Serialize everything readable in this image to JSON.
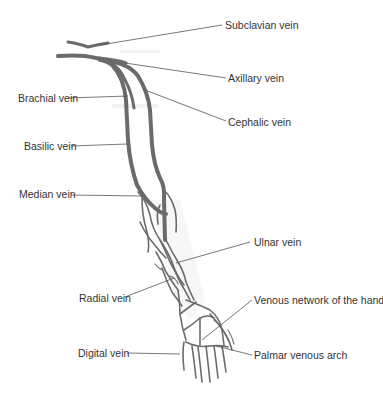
{
  "diagram": {
    "colors": {
      "vein": "#6b6b6b",
      "leader": "#555555",
      "label": "#333333",
      "background": "#ffffff"
    },
    "labels": {
      "subclavian": "Subclavian vein",
      "axillary": "Axillary vein",
      "brachial": "Brachial vein",
      "cephalic": "Cephalic vein",
      "basilic": "Basilic vein",
      "median": "Median vein",
      "ulnar": "Ulnar vein",
      "radial": "Radial vein",
      "venous_network_hand": "Venous network of the hand",
      "digital": "Digital vein",
      "palmar_arch": "Palmar venous arch"
    }
  }
}
